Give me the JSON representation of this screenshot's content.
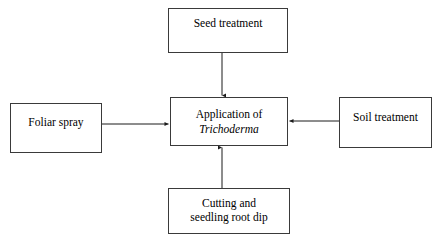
{
  "diagram": {
    "title": "Application of Trichoderma",
    "type": "flow-diagram",
    "background_color": "#ffffff",
    "stroke_color": "#3a3a3a",
    "arrow_color": "#1a1a1a",
    "nodes": {
      "seed_treatment": {
        "label": "Seed treatment",
        "line1": "Seed treatment"
      },
      "center": {
        "label": "Application of Trichoderma",
        "line1": "Application of",
        "line2": "Trichoderma"
      },
      "foliar_spray": {
        "label": "Foliar spray",
        "line1": "Foliar spray"
      },
      "soil_treatment": {
        "label": "Soil treatment",
        "line1": "Soil treatment"
      },
      "cutting_root_dip": {
        "label": "Cutting and seedling root dip",
        "line1": "Cutting and",
        "line2": "seedling root dip"
      }
    },
    "edges": [
      {
        "name": "seed-treatment-to-center",
        "from": "seed_treatment",
        "to": "center",
        "direction": "down"
      },
      {
        "name": "foliar-spray-to-center",
        "from": "foliar_spray",
        "to": "center",
        "direction": "right"
      },
      {
        "name": "soil-treatment-to-center",
        "from": "soil_treatment",
        "to": "center",
        "direction": "left"
      },
      {
        "name": "cutting-root-dip-to-center",
        "from": "cutting_root_dip",
        "to": "center",
        "direction": "up"
      }
    ]
  }
}
